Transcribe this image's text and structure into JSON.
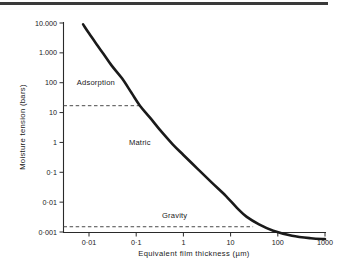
{
  "chart_data": {
    "type": "line",
    "title": "",
    "xlabel": "Equivalent film thickness (µm)",
    "ylabel": "Moisture tension (bars)",
    "xscale": "log",
    "yscale": "log",
    "xlim": [
      0.003,
      1000
    ],
    "ylim": [
      0.001,
      10000
    ],
    "grid": false,
    "legend": null,
    "x_ticks": [
      {
        "value": 0.01,
        "label": "0·01"
      },
      {
        "value": 0.1,
        "label": "0·1"
      },
      {
        "value": 1,
        "label": "1"
      },
      {
        "value": 10,
        "label": "10"
      },
      {
        "value": 100,
        "label": "100"
      },
      {
        "value": 1000,
        "label": "1000"
      }
    ],
    "y_ticks": [
      {
        "value": 10000,
        "label": "10.000"
      },
      {
        "value": 1000,
        "label": "1.000"
      },
      {
        "value": 100,
        "label": "100"
      },
      {
        "value": 10,
        "label": "10"
      },
      {
        "value": 1,
        "label": "1"
      },
      {
        "value": 0.1,
        "label": "0·1"
      },
      {
        "value": 0.01,
        "label": "0·01"
      },
      {
        "value": 0.001,
        "label": "0·001"
      }
    ],
    "series": [
      {
        "name": "Moisture tension vs equivalent film thickness",
        "style": "solid-thick",
        "color": "#1a1a1a",
        "points": [
          {
            "x": 0.0075,
            "y": 9000
          },
          {
            "x": 0.01,
            "y": 4500
          },
          {
            "x": 0.015,
            "y": 1800
          },
          {
            "x": 0.02,
            "y": 950
          },
          {
            "x": 0.03,
            "y": 380
          },
          {
            "x": 0.05,
            "y": 140
          },
          {
            "x": 0.08,
            "y": 45
          },
          {
            "x": 0.12,
            "y": 17
          },
          {
            "x": 0.2,
            "y": 6.5
          },
          {
            "x": 0.35,
            "y": 2.2
          },
          {
            "x": 0.6,
            "y": 0.85
          },
          {
            "x": 1,
            "y": 0.38
          },
          {
            "x": 2,
            "y": 0.13
          },
          {
            "x": 4,
            "y": 0.045
          },
          {
            "x": 8,
            "y": 0.016
          },
          {
            "x": 15,
            "y": 0.0055
          },
          {
            "x": 22,
            "y": 0.0032
          },
          {
            "x": 40,
            "y": 0.0018
          },
          {
            "x": 80,
            "y": 0.0011
          },
          {
            "x": 200,
            "y": 0.00075
          },
          {
            "x": 500,
            "y": 0.00062
          },
          {
            "x": 1000,
            "y": 0.00058
          }
        ]
      }
    ],
    "reference_lines": [
      {
        "name": "adsorption-matric-boundary",
        "orientation": "horizontal",
        "y": 17,
        "x_start": 0.003,
        "x_end": 0.12,
        "style": "dashed"
      },
      {
        "name": "matric-gravity-boundary",
        "orientation": "horizontal",
        "y": 0.0015,
        "x_start": 0.003,
        "x_end": 30,
        "style": "dashed"
      }
    ],
    "annotations": [
      {
        "name": "adsorption",
        "text": "Adsorption",
        "x": 0.0055,
        "y": 100
      },
      {
        "name": "matric",
        "text": "Matric",
        "x": 0.07,
        "y": 1
      },
      {
        "name": "gravity",
        "text": "Gravity",
        "x": 0.35,
        "y": 0.0035
      }
    ]
  },
  "axes": {
    "x_title": "Equivalent film thickness (µm)",
    "y_title": "Moisture tension (bars)"
  },
  "colors": {
    "curve": "#1a1a1a",
    "dashed": "#4a4a4a",
    "axis": "#2a2a2a",
    "text": "#1a1a1a",
    "background": "#ffffff",
    "top_rule": "#3a3a3a"
  }
}
